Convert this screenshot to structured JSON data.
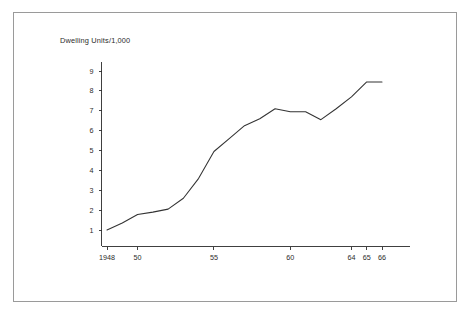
{
  "figure": {
    "header_label": "Dwelling Units/1,000",
    "frame_color": "#9a9a9a",
    "line_color": "#333333",
    "axis_color": "#2b2b2b",
    "background": "#ffffff"
  },
  "chart_data": {
    "type": "line",
    "title": "Dwelling Units/1,000",
    "xlabel": "",
    "ylabel": "Dwelling Units/1,000",
    "grid": false,
    "legend": false,
    "xlim": [
      1948,
      1966
    ],
    "ylim": [
      0,
      9.6
    ],
    "yticks": [
      1,
      2,
      3,
      4,
      5,
      6,
      7,
      8,
      9
    ],
    "ytick_labels": [
      "1",
      "2",
      "3",
      "4",
      "5",
      "6",
      "7",
      "8",
      "9"
    ],
    "xticks": [
      1948,
      1950,
      1955,
      1960,
      1964,
      1965,
      1966
    ],
    "xtick_labels": [
      "1948",
      "50",
      "55",
      "60",
      "64",
      "65",
      "66"
    ],
    "x": [
      1948,
      1949,
      1950,
      1951,
      1952,
      1953,
      1954,
      1955,
      1956,
      1957,
      1958,
      1959,
      1960,
      1961,
      1962,
      1963,
      1964,
      1965,
      1966
    ],
    "values": [
      1.0,
      1.35,
      1.78,
      1.9,
      2.05,
      2.6,
      3.6,
      4.95,
      5.6,
      6.25,
      6.6,
      7.1,
      6.95,
      6.95,
      6.55,
      7.1,
      7.7,
      8.45,
      8.45
    ],
    "series": [
      {
        "name": "Dwelling Units per 1,000",
        "values": [
          1.0,
          1.35,
          1.78,
          1.9,
          2.05,
          2.6,
          3.6,
          4.95,
          5.6,
          6.25,
          6.6,
          7.1,
          6.95,
          6.95,
          6.55,
          7.1,
          7.7,
          8.45,
          8.45
        ]
      }
    ]
  }
}
